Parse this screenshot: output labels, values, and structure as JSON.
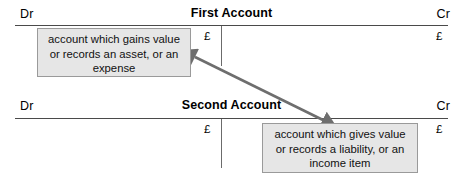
{
  "diagram": {
    "arrow": {
      "name": "double-headed-arrow",
      "color": "#6e6e6e",
      "from_label": "account which gains value or records an asset, or an expense",
      "to_label": "account which gives value or records a liability, or an income item"
    },
    "colors": {
      "rule": "#4a4a4a",
      "callout_fill": "#e6e6e6",
      "callout_border": "#9a9a9a",
      "arrow": "#6e6e6e",
      "text": "#000000",
      "background": "#ffffff"
    },
    "accounts": [
      {
        "id": "first",
        "title": "First Account",
        "debit_label": "Dr",
        "credit_label": "Cr",
        "debit_currency": "£",
        "credit_currency": "£"
      },
      {
        "id": "second",
        "title": "Second Account",
        "debit_label": "Dr",
        "credit_label": "Cr",
        "debit_currency": "£",
        "credit_currency": "£"
      }
    ],
    "callouts": [
      {
        "id": "debit",
        "side": "debit",
        "lines": [
          "account which gains value",
          "or records an asset, or an",
          "expense"
        ]
      },
      {
        "id": "credit",
        "side": "credit",
        "lines": [
          "account which gives value",
          "or records a liability, or an",
          "income item"
        ]
      }
    ]
  }
}
